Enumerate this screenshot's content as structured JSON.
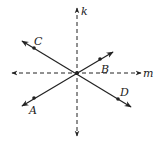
{
  "diagram": {
    "title": "",
    "colors": {
      "line": "#222222",
      "background": "#ffffff"
    },
    "center": {
      "x": 77,
      "y": 73
    },
    "lines": [
      {
        "name": "k",
        "style": "dashed",
        "direction": "vertical",
        "x1": 77,
        "y1": 8,
        "x2": 77,
        "y2": 136,
        "arrows": "both"
      },
      {
        "name": "m",
        "style": "dashed",
        "direction": "horizontal",
        "x1": 12,
        "y1": 73,
        "x2": 141,
        "y2": 73,
        "arrows": "both"
      },
      {
        "name": "CD",
        "style": "solid",
        "x1": 22,
        "y1": 41,
        "x2": 131,
        "y2": 107,
        "arrows": "both"
      },
      {
        "name": "AB",
        "style": "solid",
        "x1": 22,
        "y1": 106,
        "x2": 113,
        "y2": 52,
        "arrows": "both"
      }
    ],
    "points": [
      {
        "name": "C",
        "x": 34,
        "y": 48
      },
      {
        "name": "B",
        "x": 100,
        "y": 59
      },
      {
        "name": "A",
        "x": 34,
        "y": 98
      },
      {
        "name": "D",
        "x": 118,
        "y": 99
      },
      {
        "name": "center",
        "x": 77,
        "y": 73
      }
    ],
    "labels": {
      "k": "k",
      "m": "m",
      "A": "A",
      "B": "B",
      "C": "C",
      "D": "D"
    }
  }
}
